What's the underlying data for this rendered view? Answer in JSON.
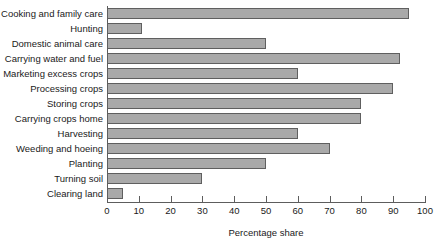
{
  "chart_data": {
    "type": "bar",
    "orientation": "horizontal",
    "title": "",
    "xlabel": "Percentage share",
    "ylabel": "",
    "xlim": [
      0,
      100
    ],
    "xticks": [
      0,
      10,
      20,
      30,
      40,
      50,
      60,
      70,
      80,
      90,
      100
    ],
    "grid": false,
    "legend": null,
    "categories": [
      "Cooking and family care",
      "Hunting",
      "Domestic animal care",
      "Carrying water and fuel",
      "Marketing excess crops",
      "Processing crops",
      "Storing crops",
      "Carrying crops home",
      "Harvesting",
      "Weeding and hoeing",
      "Planting",
      "Turning soil",
      "Clearing land"
    ],
    "values": [
      95,
      11,
      50,
      92,
      60,
      90,
      80,
      80,
      60,
      70,
      50,
      30,
      5
    ],
    "bar_fill_color": "#a9a9a9",
    "bar_border_color": "#5f5f5f",
    "axis_color": "#5d5d5d",
    "background_color": "#ffffff"
  }
}
